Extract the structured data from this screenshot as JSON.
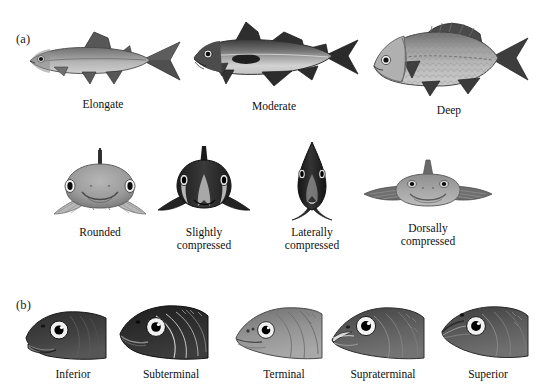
{
  "figure": {
    "panels": [
      {
        "id": "a",
        "label": "(a)",
        "topic": "body-shape"
      },
      {
        "id": "b",
        "label": "(b)",
        "topic": "mouth-position"
      }
    ]
  },
  "body_shapes_lateral": {
    "row_label": "Lateral body profiles",
    "items": [
      {
        "name": "elongate",
        "caption": "Elongate",
        "body_color": "#8d8d8d",
        "fin_color": "#4a4a4a"
      },
      {
        "name": "moderate",
        "caption": "Moderate",
        "body_color": "#7c7c7c",
        "fin_color": "#2f2f2f"
      },
      {
        "name": "deep",
        "caption": "Deep",
        "body_color": "#9a9a9a",
        "fin_color": "#3c3c3c"
      }
    ]
  },
  "body_shapes_cross_section": {
    "row_label": "Frontal cross-section profiles",
    "items": [
      {
        "name": "rounded",
        "caption": "Rounded",
        "body_color": "#a2a2a2",
        "fin_color": "#8f8f8f"
      },
      {
        "name": "slightly-compressed",
        "caption": "Slightly\ncompressed",
        "body_color": "#2a2a2a",
        "fin_color": "#1a1a1a"
      },
      {
        "name": "laterally-compressed",
        "caption": "Laterally\ncompressed",
        "body_color": "#222222",
        "fin_color": "#101010"
      },
      {
        "name": "dorsally-compressed",
        "caption": "Dorsally\ncompressed",
        "body_color": "#9c9c9c",
        "fin_color": "#6e6e6e"
      }
    ]
  },
  "mouth_positions": {
    "row_label": "Mouth positions",
    "items": [
      {
        "name": "inferior",
        "caption": "Inferior",
        "head_color": "#3a3a3a",
        "mouth_color": "#6d6d6d"
      },
      {
        "name": "subterminal",
        "caption": "Subterminal",
        "head_color": "#2b2b2b",
        "mouth_color": "#565656"
      },
      {
        "name": "terminal",
        "caption": "Terminal",
        "head_color": "#8b8b8b",
        "mouth_color": "#9c9c9c"
      },
      {
        "name": "supraterminal",
        "caption": "Supraterminal",
        "head_color": "#5e5e5e",
        "mouth_color": "#c9c9c9"
      },
      {
        "name": "superior",
        "caption": "Superior",
        "head_color": "#5a5a5a",
        "mouth_color": "#8a8a8a"
      }
    ]
  },
  "palette": {
    "background": "#ffffff",
    "text": "#0f0f0f",
    "eye_ring": "#ffffff",
    "eye_pupil": "#000000",
    "outline": "#1c1c1c"
  }
}
